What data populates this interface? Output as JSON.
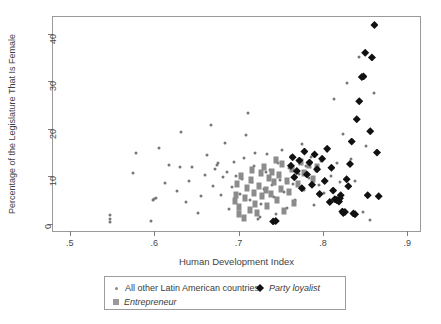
{
  "chart_data": {
    "type": "scatter",
    "title": "",
    "xlabel": "Human Development Index",
    "ylabel": "Percentage of the Legislature That Is Female",
    "xlim": [
      0.48,
      0.915
    ],
    "ylim": [
      -1.5,
      43.5
    ],
    "xticks": [
      0.5,
      0.6,
      0.7,
      0.8,
      0.9
    ],
    "xticklabels": [
      ".5",
      ".6",
      ".7",
      ".8",
      ".9"
    ],
    "yticks": [
      0,
      10,
      20,
      30,
      40
    ],
    "yticklabels": [
      "0",
      "10",
      "20",
      "30",
      "40"
    ],
    "grid": false,
    "legend_position": "below-axes",
    "series": [
      {
        "name": "All other Latin American countries",
        "marker": "small-circle",
        "color": "#777777",
        "points": [
          [
            0.547,
            0.4
          ],
          [
            0.547,
            1.1
          ],
          [
            0.547,
            1.8
          ],
          [
            0.575,
            10.6
          ],
          [
            0.578,
            14.9
          ],
          [
            0.596,
            0.6
          ],
          [
            0.598,
            5.0
          ],
          [
            0.6,
            5.2
          ],
          [
            0.602,
            5.5
          ],
          [
            0.606,
            16.0
          ],
          [
            0.613,
            8.6
          ],
          [
            0.618,
            12.4
          ],
          [
            0.627,
            7.0
          ],
          [
            0.63,
            12.0
          ],
          [
            0.632,
            19.4
          ],
          [
            0.638,
            4.5
          ],
          [
            0.641,
            9.0
          ],
          [
            0.645,
            11.9
          ],
          [
            0.652,
            2.3
          ],
          [
            0.655,
            5.8
          ],
          [
            0.66,
            10.3
          ],
          [
            0.663,
            14.4
          ],
          [
            0.667,
            20.8
          ],
          [
            0.67,
            8.0
          ],
          [
            0.672,
            11.6
          ],
          [
            0.674,
            12.3
          ],
          [
            0.676,
            12.9
          ],
          [
            0.679,
            6.1
          ],
          [
            0.682,
            9.8
          ],
          [
            0.684,
            17.0
          ],
          [
            0.686,
            11.0
          ],
          [
            0.689,
            3.1
          ],
          [
            0.692,
            7.8
          ],
          [
            0.694,
            13.1
          ],
          [
            0.697,
            10.1
          ],
          [
            0.7,
            2.5
          ],
          [
            0.702,
            6.3
          ],
          [
            0.704,
            9.4
          ],
          [
            0.706,
            13.8
          ],
          [
            0.709,
            18.6
          ],
          [
            0.711,
            23.4
          ],
          [
            0.713,
            5.0
          ],
          [
            0.716,
            8.8
          ],
          [
            0.718,
            12.1
          ],
          [
            0.72,
            15.0
          ],
          [
            0.723,
            1.0
          ],
          [
            0.725,
            1.4
          ],
          [
            0.727,
            4.2
          ],
          [
            0.73,
            7.4
          ],
          [
            0.732,
            10.9
          ],
          [
            0.734,
            14.6
          ],
          [
            0.737,
            11.3
          ],
          [
            0.739,
            8.2
          ],
          [
            0.742,
            5.6
          ],
          [
            0.744,
            2.0
          ],
          [
            0.747,
            12.7
          ],
          [
            0.749,
            9.2
          ],
          [
            0.752,
            15.6
          ],
          [
            0.754,
            6.7
          ],
          [
            0.757,
            3.3
          ],
          [
            0.76,
            11.7
          ],
          [
            0.762,
            14.2
          ],
          [
            0.765,
            8.4
          ],
          [
            0.767,
            5.1
          ],
          [
            0.77,
            13.5
          ],
          [
            0.772,
            10.4
          ],
          [
            0.775,
            16.9
          ],
          [
            0.777,
            7.2
          ],
          [
            0.78,
            12.2
          ],
          [
            0.783,
            9.6
          ],
          [
            0.786,
            14.0
          ],
          [
            0.789,
            4.0
          ],
          [
            0.792,
            11.1
          ],
          [
            0.795,
            8.1
          ],
          [
            0.798,
            13.2
          ],
          [
            0.801,
            6.4
          ],
          [
            0.805,
            15.3
          ],
          [
            0.809,
            10.0
          ],
          [
            0.813,
            26.3
          ],
          [
            0.817,
            12.8
          ],
          [
            0.82,
            8.7
          ],
          [
            0.824,
            19.0
          ],
          [
            0.828,
            29.7
          ],
          [
            0.833,
            13.6
          ],
          [
            0.838,
            9.1
          ],
          [
            0.843,
            35.0
          ],
          [
            0.847,
            2.6
          ],
          [
            0.851,
            16.3
          ],
          [
            0.856,
            0.9
          ],
          [
            0.861,
            27.5
          ]
        ]
      },
      {
        "name": "Entrepreneur",
        "marker": "square",
        "color": "#8c8c8c",
        "points": [
          [
            0.696,
            4.8
          ],
          [
            0.697,
            6.0
          ],
          [
            0.698,
            8.4
          ],
          [
            0.7,
            2.1
          ],
          [
            0.701,
            3.5
          ],
          [
            0.703,
            10.1
          ],
          [
            0.706,
            1.2
          ],
          [
            0.708,
            5.4
          ],
          [
            0.71,
            7.6
          ],
          [
            0.713,
            3.0
          ],
          [
            0.715,
            9.2
          ],
          [
            0.716,
            11.3
          ],
          [
            0.718,
            6.5
          ],
          [
            0.72,
            4.1
          ],
          [
            0.722,
            2.3
          ],
          [
            0.724,
            8.0
          ],
          [
            0.726,
            10.6
          ],
          [
            0.728,
            5.9
          ],
          [
            0.73,
            12.0
          ],
          [
            0.732,
            7.1
          ],
          [
            0.734,
            3.8
          ],
          [
            0.736,
            9.7
          ],
          [
            0.738,
            6.2
          ],
          [
            0.74,
            11.0
          ],
          [
            0.742,
            8.8
          ],
          [
            0.744,
            13.4
          ],
          [
            0.746,
            5.0
          ],
          [
            0.748,
            10.2
          ],
          [
            0.75,
            7.4
          ],
          [
            0.752,
            12.6
          ],
          [
            0.754,
            2.8
          ],
          [
            0.757,
            9.0
          ],
          [
            0.76,
            6.8
          ],
          [
            0.763,
            11.6
          ],
          [
            0.766,
            4.4
          ],
          [
            0.77,
            8.3
          ],
          [
            0.774,
            13.0
          ],
          [
            0.778,
            10.8
          ],
          [
            0.783,
            12.4
          ],
          [
            0.788,
            9.5
          ],
          [
            0.793,
            11.9
          ]
        ]
      },
      {
        "name": "Party loyalist",
        "marker": "diamond",
        "color": "#111111",
        "points": [
          [
            0.741,
            0.5
          ],
          [
            0.744,
            0.6
          ],
          [
            0.762,
            12.2
          ],
          [
            0.764,
            14.0
          ],
          [
            0.766,
            9.8
          ],
          [
            0.769,
            11.1
          ],
          [
            0.772,
            13.3
          ],
          [
            0.775,
            7.5
          ],
          [
            0.778,
            15.2
          ],
          [
            0.781,
            10.4
          ],
          [
            0.784,
            12.9
          ],
          [
            0.787,
            8.2
          ],
          [
            0.79,
            14.6
          ],
          [
            0.793,
            11.5
          ],
          [
            0.796,
            6.3
          ],
          [
            0.799,
            13.7
          ],
          [
            0.802,
            9.0
          ],
          [
            0.805,
            15.8
          ],
          [
            0.808,
            4.6
          ],
          [
            0.81,
            11.8
          ],
          [
            0.812,
            7.0
          ],
          [
            0.814,
            5.2
          ],
          [
            0.816,
            5.0
          ],
          [
            0.818,
            4.9
          ],
          [
            0.819,
            4.7
          ],
          [
            0.82,
            5.4
          ],
          [
            0.821,
            6.0
          ],
          [
            0.823,
            2.6
          ],
          [
            0.824,
            2.3
          ],
          [
            0.826,
            2.5
          ],
          [
            0.828,
            9.4
          ],
          [
            0.83,
            7.9
          ],
          [
            0.832,
            12.6
          ],
          [
            0.834,
            17.3
          ],
          [
            0.836,
            2.2
          ],
          [
            0.838,
            2.0
          ],
          [
            0.84,
            22.0
          ],
          [
            0.843,
            25.8
          ],
          [
            0.846,
            30.9
          ],
          [
            0.848,
            31.0
          ],
          [
            0.85,
            36.0
          ],
          [
            0.853,
            6.0
          ],
          [
            0.856,
            19.5
          ],
          [
            0.858,
            35.0
          ],
          [
            0.861,
            41.8
          ],
          [
            0.864,
            15.0
          ],
          [
            0.866,
            5.8
          ]
        ]
      }
    ]
  },
  "legend": {
    "entries": [
      {
        "label": "All other Latin American countries",
        "marker": "small-circle-icon",
        "italic": false
      },
      {
        "label": "Party loyalist",
        "marker": "diamond-icon",
        "italic": true
      },
      {
        "label": "Entrepreneur",
        "marker": "square-icon",
        "italic": true
      }
    ]
  }
}
